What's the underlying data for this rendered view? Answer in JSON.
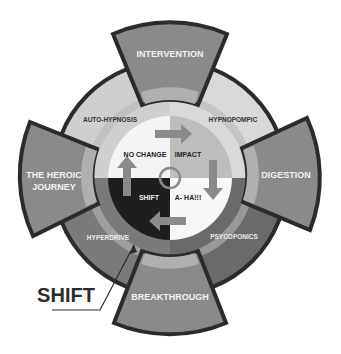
{
  "diagram": {
    "tabs": [
      {
        "id": "top",
        "label": "INTERVENTION"
      },
      {
        "id": "left",
        "line1": "THE HEROIC",
        "line2": "JOURNEY"
      },
      {
        "id": "right",
        "label": "DIGESTION"
      },
      {
        "id": "bottom",
        "label": "BREAKTHROUGH"
      }
    ],
    "ring": {
      "top_left": "AUTO-HYPNOSIS",
      "top_right": "HYPNOPOMPIC",
      "bottom_left": "HYPERDRIVE",
      "bottom_right": "PSYCOPONICS"
    },
    "quadrants": {
      "top_left": "NO CHANGE",
      "top_right": "IMPACT",
      "bottom_left": "SHIFT",
      "bottom_right": "A- HA!!!"
    },
    "callout": "SHIFT",
    "colors": {
      "ring_light": "#c9c9c9",
      "ring_dark": "#6f6f6f",
      "tab": "#8a8a8a",
      "tab_band": "#b0b0b0",
      "outline": "#2b2b2b",
      "quad_dark": "#1e1e1e",
      "quad_mid": "#bdbdbd"
    }
  }
}
